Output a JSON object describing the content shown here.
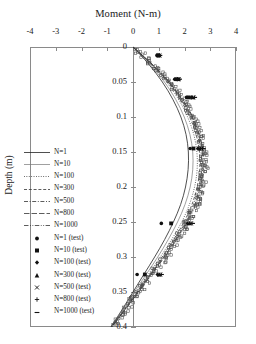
{
  "chart_data": {
    "type": "line",
    "title": "Moment (N-m)",
    "xlabel": "Moment (N-m)",
    "ylabel": "Depth (m)",
    "xlim": [
      -4,
      4
    ],
    "ylim": [
      0,
      0.4
    ],
    "y_inverted": true,
    "grid": false,
    "legend_position": "left-middle",
    "xticks": [
      "-4",
      "-3",
      "-2",
      "-1",
      "0",
      "1",
      "2",
      "3",
      "4"
    ],
    "xtick_values": [
      -4,
      -3,
      -2,
      -1,
      0,
      1,
      2,
      3,
      4
    ],
    "yticks": [
      "0",
      "0.05",
      "0.1",
      "0.15",
      "0.2",
      "0.25",
      "0.3",
      "0.35",
      "0.4"
    ],
    "ytick_values": [
      0,
      0.05,
      0.1,
      0.15,
      0.2,
      0.25,
      0.3,
      0.35,
      0.4
    ],
    "depths": [
      0,
      0.025,
      0.05,
      0.075,
      0.1,
      0.125,
      0.15,
      0.175,
      0.2,
      0.225,
      0.25,
      0.275,
      0.3,
      0.325,
      0.35,
      0.375,
      0.4
    ],
    "series": [
      {
        "name": "N=1",
        "style": "solid",
        "width": 0.8,
        "color": "#222222",
        "values": [
          0,
          0.62,
          1.14,
          1.55,
          1.86,
          2.06,
          2.15,
          2.14,
          2.04,
          1.85,
          1.57,
          1.23,
          0.84,
          0.42,
          0.0,
          -0.42,
          -0.86
        ]
      },
      {
        "name": "N=10",
        "style": "solid-thin",
        "width": 0.7,
        "color": "#777777",
        "values": [
          0,
          0.66,
          1.22,
          1.66,
          1.99,
          2.21,
          2.32,
          2.32,
          2.22,
          2.02,
          1.73,
          1.37,
          0.96,
          0.51,
          0.05,
          -0.4,
          -0.86
        ]
      },
      {
        "name": "N=100",
        "style": "dotted",
        "width": 0.8,
        "color": "#333333",
        "values": [
          0,
          0.7,
          1.3,
          1.77,
          2.12,
          2.36,
          2.48,
          2.49,
          2.39,
          2.19,
          1.89,
          1.5,
          1.06,
          0.59,
          0.11,
          -0.37,
          -0.85
        ]
      },
      {
        "name": "N=300",
        "style": "dashed",
        "width": 0.8,
        "color": "#333333",
        "values": [
          0,
          0.72,
          1.34,
          1.83,
          2.2,
          2.45,
          2.58,
          2.59,
          2.49,
          2.29,
          1.98,
          1.58,
          1.13,
          0.64,
          0.15,
          -0.34,
          -0.84
        ]
      },
      {
        "name": "N=500",
        "style": "dashdot",
        "width": 0.8,
        "color": "#333333",
        "values": [
          0,
          0.74,
          1.37,
          1.87,
          2.25,
          2.51,
          2.64,
          2.66,
          2.56,
          2.35,
          2.04,
          1.63,
          1.17,
          0.67,
          0.18,
          -0.32,
          -0.83
        ]
      },
      {
        "name": "N=800",
        "style": "longdash",
        "width": 0.8,
        "color": "#333333",
        "values": [
          0,
          0.75,
          1.39,
          1.9,
          2.29,
          2.55,
          2.69,
          2.71,
          2.61,
          2.4,
          2.08,
          1.67,
          1.2,
          0.7,
          0.2,
          -0.31,
          -0.82
        ]
      },
      {
        "name": "N=1000",
        "style": "dashdotdot",
        "width": 0.8,
        "color": "#333333",
        "values": [
          0,
          0.76,
          1.41,
          1.93,
          2.32,
          2.58,
          2.73,
          2.75,
          2.65,
          2.44,
          2.12,
          1.7,
          1.23,
          0.72,
          0.22,
          -0.3,
          -0.82
        ]
      }
    ],
    "test_series": [
      {
        "name": "N=1 (test)",
        "marker": "circle",
        "points": [
          [
            0.93,
            0.012
          ],
          [
            1.62,
            0.046
          ],
          [
            2.08,
            0.072
          ],
          [
            2.22,
            0.145
          ],
          [
            1.1,
            0.252
          ],
          [
            0.16,
            0.325
          ]
        ]
      },
      {
        "name": "N=10 (test)",
        "marker": "square",
        "points": [
          [
            0.97,
            0.012
          ],
          [
            1.68,
            0.046
          ],
          [
            2.16,
            0.072
          ],
          [
            2.35,
            0.145
          ],
          [
            1.48,
            0.252
          ],
          [
            0.46,
            0.325
          ]
        ]
      },
      {
        "name": "N=100 (test)",
        "marker": "diamond",
        "points": [
          [
            1.0,
            0.012
          ],
          [
            1.73,
            0.046
          ],
          [
            2.26,
            0.072
          ],
          [
            2.52,
            0.145
          ],
          [
            2.12,
            0.252
          ],
          [
            0.95,
            0.325
          ]
        ]
      },
      {
        "name": "N=300 (test)",
        "marker": "triangle",
        "points": [
          [
            1.02,
            0.012
          ],
          [
            1.76,
            0.046
          ],
          [
            2.31,
            0.072
          ],
          [
            2.6,
            0.145
          ],
          [
            2.2,
            0.252
          ],
          [
            1.02,
            0.325
          ]
        ]
      },
      {
        "name": "N=500 (test)",
        "marker": "cross-x",
        "points": [
          [
            1.03,
            0.012
          ],
          [
            1.78,
            0.046
          ],
          [
            2.35,
            0.072
          ],
          [
            2.66,
            0.145
          ],
          [
            2.25,
            0.252
          ],
          [
            1.06,
            0.325
          ]
        ]
      },
      {
        "name": "N=800 (test)",
        "marker": "plus",
        "points": [
          [
            1.04,
            0.012
          ],
          [
            1.8,
            0.046
          ],
          [
            2.38,
            0.072
          ],
          [
            2.7,
            0.145
          ],
          [
            2.29,
            0.252
          ],
          [
            1.09,
            0.325
          ]
        ]
      },
      {
        "name": "N=1000 (test)",
        "marker": "dash",
        "points": [
          [
            1.05,
            0.012
          ],
          [
            1.81,
            0.046
          ],
          [
            2.4,
            0.072
          ],
          [
            2.73,
            0.145
          ],
          [
            2.32,
            0.252
          ],
          [
            1.11,
            0.325
          ]
        ]
      }
    ],
    "scatter_cloud_note": "open square markers densely overlaying the N>=100 curve bundle"
  },
  "legend": {
    "lines": [
      {
        "label": "N=1"
      },
      {
        "label": "N=10"
      },
      {
        "label": "N=100"
      },
      {
        "label": "N=300"
      },
      {
        "label": "N=500"
      },
      {
        "label": "N=800"
      },
      {
        "label": "N=1000"
      }
    ],
    "markers": [
      {
        "label": "N=1 (test)"
      },
      {
        "label": "N=10 (test)"
      },
      {
        "label": "N=100 (test)"
      },
      {
        "label": "N=300 (test)"
      },
      {
        "label": "N=500 (test)"
      },
      {
        "label": "N=800 (test)"
      },
      {
        "label": "N=1000 (test)"
      }
    ]
  },
  "colors": {
    "axis": "#8a8a8a",
    "text": "#1a1a1a",
    "curve": "#333333"
  }
}
